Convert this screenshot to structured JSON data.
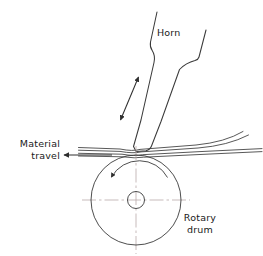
{
  "figure": {
    "type": "technical-line-diagram",
    "background_color": "#ffffff",
    "line_color": "#3a3a3a",
    "centerline_color": "#b9a9a9",
    "text_color": "#1a1a1a"
  },
  "labels": {
    "horn": "Horn",
    "material_travel_line1": "Material",
    "material_travel_line2": "travel",
    "rotary_drum_line1": "Rotary",
    "rotary_drum_line2": "drum"
  },
  "geometry": {
    "horn": {
      "tip_x": 136,
      "tip_y": 151,
      "top_left_x": 157,
      "top_left_y": 12,
      "top_right_x": 206,
      "top_right_y": 30
    },
    "vibration_arrow": {
      "x1": 138,
      "y1": 77,
      "x2": 121,
      "y2": 120,
      "double_headed": true
    },
    "material_web": {
      "left_x": 78,
      "right_x": 258,
      "contact_y": 152,
      "line_count": 4
    },
    "travel_arrow": {
      "from_x": 112,
      "to_x": 63,
      "y": 155,
      "direction": "left"
    },
    "drum": {
      "center_x": 136,
      "center_y": 200,
      "outer_radius": 45,
      "hub_radius": 8,
      "centerline_half_length": 54
    },
    "rotation_arrow": {
      "radius": 32,
      "direction": "counterclockwise",
      "arrowhead_x": 110,
      "arrowhead_y": 179
    }
  }
}
